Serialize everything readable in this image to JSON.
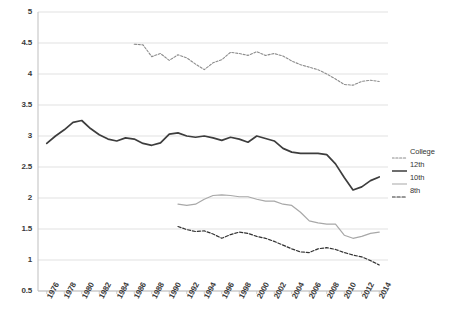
{
  "chart_data": {
    "type": "line",
    "title": "",
    "subtitle": "",
    "xlabel": "",
    "ylabel": "",
    "xlim": [
      1975,
      2015
    ],
    "ylim": [
      0.5,
      5
    ],
    "grid": true,
    "legend_position": "right",
    "y_ticks": [
      "0.5",
      "1",
      "1.5",
      "2",
      "2.5",
      "3",
      "3.5",
      "4",
      "4.5",
      "5"
    ],
    "x_ticks": [
      "1976",
      "1978",
      "1980",
      "1982",
      "1984",
      "1986",
      "1988",
      "1990",
      "1992",
      "1994",
      "1996",
      "1998",
      "2000",
      "2002",
      "2004",
      "2006",
      "2008",
      "2010",
      "2012",
      "2014"
    ],
    "series": [
      {
        "name": "College",
        "color": "#8c8c8c",
        "style": "dotted",
        "width": 1.1,
        "x": [
          1986,
          1987,
          1988,
          1989,
          1990,
          1991,
          1992,
          1993,
          1994,
          1995,
          1996,
          1997,
          1998,
          1999,
          2000,
          2001,
          2002,
          2003,
          2004,
          2005,
          2006,
          2007,
          2008,
          2009,
          2010,
          2011,
          2012,
          2013,
          2014
        ],
        "values": [
          4.48,
          4.47,
          4.28,
          4.33,
          4.22,
          4.31,
          4.26,
          4.16,
          4.07,
          4.18,
          4.23,
          4.35,
          4.33,
          4.3,
          4.36,
          4.3,
          4.33,
          4.29,
          4.21,
          4.15,
          4.11,
          4.07,
          4.0,
          3.92,
          3.83,
          3.82,
          3.88,
          3.9,
          3.88
        ]
      },
      {
        "name": "12th",
        "color": "#3d3d3d",
        "style": "solid",
        "width": 1.7,
        "x": [
          1976,
          1977,
          1978,
          1979,
          1980,
          1981,
          1982,
          1983,
          1984,
          1985,
          1986,
          1987,
          1988,
          1989,
          1990,
          1991,
          1992,
          1993,
          1994,
          1995,
          1996,
          1997,
          1998,
          1999,
          2000,
          2001,
          2002,
          2003,
          2004,
          2005,
          2006,
          2007,
          2008,
          2009,
          2010,
          2011,
          2012,
          2013,
          2014
        ],
        "values": [
          2.88,
          3.0,
          3.1,
          3.22,
          3.25,
          3.12,
          3.02,
          2.95,
          2.92,
          2.97,
          2.95,
          2.88,
          2.85,
          2.89,
          3.03,
          3.05,
          3.0,
          2.98,
          3.0,
          2.97,
          2.93,
          2.98,
          2.95,
          2.9,
          3.0,
          2.96,
          2.92,
          2.8,
          2.74,
          2.72,
          2.72,
          2.72,
          2.7,
          2.55,
          2.33,
          2.13,
          2.18,
          2.28,
          2.34
        ]
      },
      {
        "name": "10th",
        "color": "#a8a8a8",
        "style": "solid",
        "width": 1.2,
        "x": [
          1991,
          1992,
          1993,
          1994,
          1995,
          1996,
          1997,
          1998,
          1999,
          2000,
          2001,
          2002,
          2003,
          2004,
          2005,
          2006,
          2007,
          2008,
          2009,
          2010,
          2011,
          2012,
          2013,
          2014
        ],
        "values": [
          1.9,
          1.88,
          1.9,
          1.98,
          2.04,
          2.05,
          2.04,
          2.02,
          2.02,
          1.98,
          1.95,
          1.95,
          1.9,
          1.88,
          1.77,
          1.63,
          1.6,
          1.58,
          1.58,
          1.4,
          1.35,
          1.38,
          1.43,
          1.45
        ]
      },
      {
        "name": "8th",
        "color": "#333333",
        "style": "dashed",
        "width": 1.2,
        "x": [
          1991,
          1992,
          1993,
          1994,
          1995,
          1996,
          1997,
          1998,
          1999,
          2000,
          2001,
          2002,
          2003,
          2004,
          2005,
          2006,
          2007,
          2008,
          2009,
          2010,
          2011,
          2012,
          2013,
          2014
        ],
        "values": [
          1.54,
          1.49,
          1.46,
          1.47,
          1.42,
          1.35,
          1.41,
          1.45,
          1.43,
          1.38,
          1.35,
          1.3,
          1.24,
          1.18,
          1.13,
          1.12,
          1.18,
          1.2,
          1.17,
          1.12,
          1.08,
          1.05,
          0.99,
          0.92
        ]
      }
    ]
  },
  "legend": {
    "items": [
      {
        "label": "College"
      },
      {
        "label": "12th"
      },
      {
        "label": "10th"
      },
      {
        "label": "8th"
      }
    ]
  },
  "axes": {
    "grid_color": "#d9d9d9",
    "axis_color": "#bfbfbf",
    "tick_color": "#3a3a3a"
  }
}
